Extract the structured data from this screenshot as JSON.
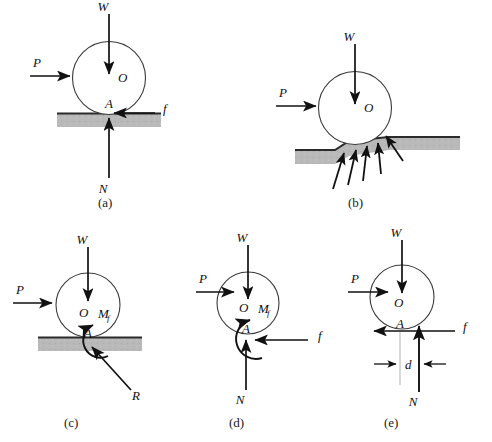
{
  "figure": {
    "background": "#ffffff",
    "ink_color": "#111111",
    "ground_fill": "#b9b9b9",
    "ground_edge": "#2b2b2b",
    "panels": [
      {
        "id": "a",
        "caption": "(a)",
        "description": "Wheel on rigid flat ground with point contact",
        "labels": {
          "weight": "W",
          "applied_force": "P",
          "center": "O",
          "contact_point": "A",
          "friction": "f",
          "normal": "N"
        }
      },
      {
        "id": "b",
        "caption": "(b)",
        "description": "Wheel deforming soft ground, distributed reaction arrows",
        "labels": {
          "weight": "W",
          "applied_force": "P",
          "center": "O"
        }
      },
      {
        "id": "c",
        "caption": "(c)",
        "description": "Resultant reaction R with rolling resistance couple M sub f",
        "labels": {
          "weight": "W",
          "applied_force": "P",
          "center": "O",
          "contact_point": "A",
          "moment": "M",
          "moment_sub": "f",
          "resultant": "R"
        }
      },
      {
        "id": "d",
        "caption": "(d)",
        "description": "Reaction resolved into N and f plus couple M sub f",
        "labels": {
          "weight": "W",
          "applied_force": "P",
          "center": "O",
          "contact_point": "A",
          "moment": "M",
          "moment_sub": "f",
          "friction": "f",
          "normal": "N"
        }
      },
      {
        "id": "e",
        "caption": "(e)",
        "description": "Equivalent system: normal force N offset by distance d",
        "labels": {
          "weight": "W",
          "applied_force": "P",
          "center": "O",
          "contact_point": "A",
          "friction": "f",
          "normal": "N",
          "offset": "d"
        }
      }
    ]
  }
}
